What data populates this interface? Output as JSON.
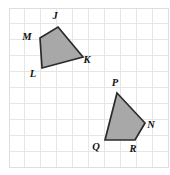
{
  "figure": {
    "background_color": "#ffffff",
    "grid": {
      "color": "#e3e3e3",
      "border_color": "#dedede",
      "origin_x": 9,
      "origin_y": 8,
      "cell_size": 15.9,
      "columns": 10,
      "rows": 10
    },
    "shape_fill_color": "#a8a8a8",
    "shape_stroke_color": "#2b2b2b",
    "polygons": [
      {
        "id": "quadrilateral-jklm",
        "name": "JKLM",
        "fill": "#a8a8a8",
        "points": "58,27 83,57 42,68 40,38",
        "vertices": [
          {
            "label": "J",
            "x": 58,
            "y": 27,
            "label_x": 55,
            "label_y": 17
          },
          {
            "label": "K",
            "x": 83,
            "y": 57,
            "label_x": 87,
            "label_y": 61
          },
          {
            "label": "L",
            "x": 42,
            "y": 68,
            "label_x": 33,
            "label_y": 75
          },
          {
            "label": "M",
            "x": 40,
            "y": 38,
            "label_x": 27,
            "label_y": 38
          }
        ]
      },
      {
        "id": "quadrilateral-pnrq",
        "name": "PNRQ",
        "fill": "#a8a8a8",
        "points": "117,93 145,123 135,140 105,140",
        "vertices": [
          {
            "label": "P",
            "x": 117,
            "y": 93,
            "label_x": 115,
            "label_y": 84
          },
          {
            "label": "N",
            "x": 145,
            "y": 123,
            "label_x": 151,
            "label_y": 126
          },
          {
            "label": "R",
            "x": 135,
            "y": 140,
            "label_x": 133,
            "label_y": 150
          },
          {
            "label": "Q",
            "x": 105,
            "y": 140,
            "label_x": 96,
            "label_y": 148
          }
        ]
      }
    ],
    "labels": [
      {
        "text": "J"
      },
      {
        "text": "K"
      },
      {
        "text": "L"
      },
      {
        "text": "M"
      },
      {
        "text": "P"
      },
      {
        "text": "N"
      },
      {
        "text": "R"
      },
      {
        "text": "Q"
      }
    ]
  }
}
